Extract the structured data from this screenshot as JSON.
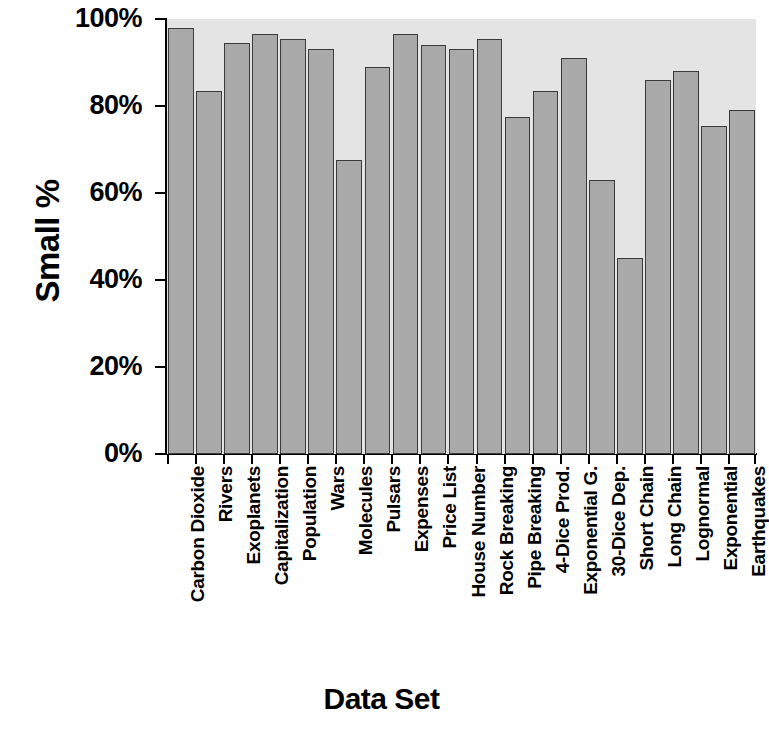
{
  "chart_data": {
    "type": "bar",
    "title": "",
    "xlabel": "Data Set",
    "ylabel": "Small %",
    "ylim": [
      0,
      100
    ],
    "ytick_labels": [
      "100%",
      "80%",
      "60%",
      "40%",
      "20%",
      "0%"
    ],
    "ytick_values": [
      100,
      80,
      60,
      40,
      20,
      0
    ],
    "grid": false,
    "legend": null,
    "bar_color": "#a9a9a9",
    "bar_edge_color": "#3b3b3b",
    "plot_background": "#e4e4e4",
    "page_background": "#ffffff",
    "axis_color": "#000000",
    "categories": [
      "Carbon Dioxide",
      "Rivers",
      "Exoplanets",
      "Capitalization",
      "Population",
      "Wars",
      "Molecules",
      "Pulsars",
      "Expenses",
      "Price List",
      "House Number",
      "Rock Breaking",
      "Pipe Breaking",
      "4-Dice Prod.",
      "Exponential G.",
      "30-Dice Dep.",
      "Short Chain",
      "Long Chain",
      "Lognormal",
      "Exponential",
      "Earthquakes"
    ],
    "values": [
      98,
      83.5,
      94.5,
      96.5,
      95.5,
      93,
      67.5,
      89,
      96.5,
      94,
      93,
      95.5,
      77.5,
      83.5,
      91,
      63,
      45,
      86,
      88,
      75.5,
      79
    ]
  }
}
